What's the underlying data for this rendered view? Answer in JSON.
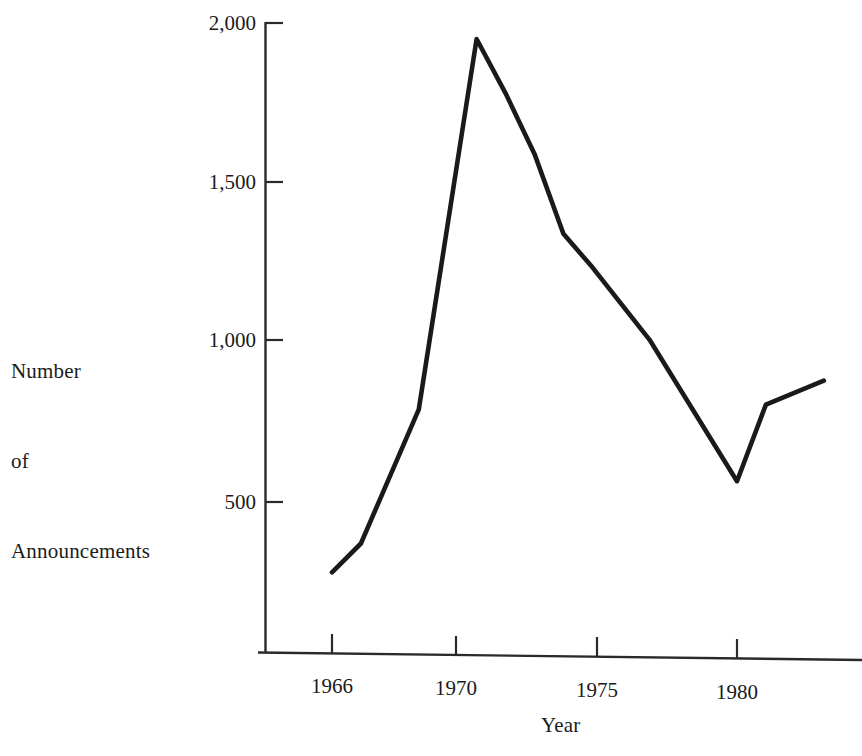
{
  "chart_data": {
    "type": "line",
    "title": "",
    "xlabel": "Year",
    "ylabel": "Number of Announcements",
    "ylabel_lines": [
      "Number",
      "of",
      "Announcements"
    ],
    "x": [
      1966,
      1967,
      1969,
      1971,
      1972,
      1973,
      1974,
      1975,
      1977,
      1980,
      1981,
      1983
    ],
    "values": [
      280,
      370,
      790,
      1950,
      1780,
      1590,
      1340,
      1235,
      1005,
      565,
      805,
      880
    ],
    "series": [
      {
        "name": "Number of Announcements",
        "points": [
          {
            "year": 1966,
            "value": 280
          },
          {
            "year": 1967,
            "value": 370
          },
          {
            "year": 1969,
            "value": 790
          },
          {
            "year": 1971,
            "value": 1950
          },
          {
            "year": 1972,
            "value": 1780
          },
          {
            "year": 1973,
            "value": 1590
          },
          {
            "year": 1974,
            "value": 1340
          },
          {
            "year": 1975,
            "value": 1235
          },
          {
            "year": 1977,
            "value": 1005
          },
          {
            "year": 1980,
            "value": 565
          },
          {
            "year": 1981,
            "value": 805
          },
          {
            "year": 1983,
            "value": 880
          }
        ]
      }
    ],
    "xlim": [
      1964.5,
      1983.5
    ],
    "ylim": [
      0,
      2060
    ],
    "xticks": [
      1966,
      1970,
      1975,
      1980
    ],
    "xtick_labels": [
      "1966",
      "1970",
      "1975",
      "1980"
    ],
    "yticks": [
      500,
      1000,
      1500,
      2000
    ],
    "ytick_labels": [
      "500",
      "1,000",
      "1,500",
      "2,000"
    ],
    "grid": false,
    "legend": "none",
    "line_color": "#1a1a1a",
    "axis_color": "#2a2a2a",
    "background_color": "#ffffff"
  },
  "axes": {
    "y_axis_name": "number-of-announcements-axis",
    "x_axis_name": "year-axis"
  }
}
